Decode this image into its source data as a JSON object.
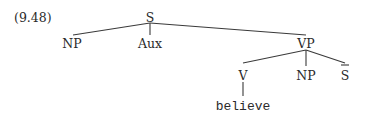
{
  "example_number": "(9.48)",
  "tree": {
    "root": "S",
    "nodes": {
      "S": "S",
      "NP1": "NP",
      "Aux": "Aux",
      "VP": "VP",
      "V": "V",
      "NP2": "NP",
      "Sbar": "S",
      "verb": "believe"
    },
    "edges": [
      [
        "S",
        "NP1"
      ],
      [
        "S",
        "Aux"
      ],
      [
        "S",
        "VP"
      ],
      [
        "VP",
        "V"
      ],
      [
        "VP",
        "NP2"
      ],
      [
        "VP",
        "Sbar"
      ],
      [
        "V",
        "verb"
      ]
    ]
  }
}
